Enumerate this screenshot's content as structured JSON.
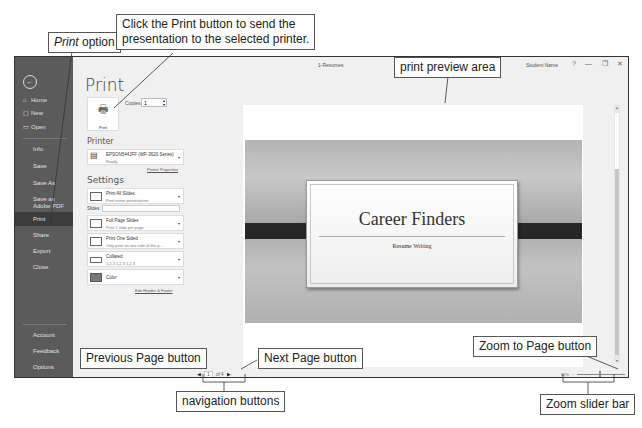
{
  "callouts": {
    "print_option": {
      "italic": "Print",
      "rest": " option"
    },
    "print_button": "Click the Print button to send the presentation to the selected printer.",
    "print_button_line1": "Click the Print button to send the",
    "print_button_line2": "presentation to the selected printer.",
    "preview_area": "print preview area",
    "prev_page": "Previous Page button",
    "next_page": "Next Page button",
    "nav_buttons": "navigation buttons",
    "zoom_to_page": "Zoom to Page button",
    "zoom_slider": "Zoom slider bar"
  },
  "window": {
    "title": "1-Resumes",
    "user": "Student Name",
    "help": "?",
    "minimize": "—",
    "restore": "❐",
    "close": "✕"
  },
  "backstage": {
    "back_icon": "back-arrow-icon",
    "items": [
      {
        "label": "Home",
        "icon": "⌂"
      },
      {
        "label": "New",
        "icon": "▢"
      },
      {
        "label": "Open",
        "icon": "▭"
      },
      {
        "label": "Info"
      },
      {
        "label": "Save"
      },
      {
        "label": "Save As"
      },
      {
        "label": "Save as Adobe PDF"
      },
      {
        "label": "Print",
        "active": true
      },
      {
        "label": "Share"
      },
      {
        "label": "Export"
      },
      {
        "label": "Close"
      },
      {
        "label": "Account"
      },
      {
        "label": "Feedback"
      },
      {
        "label": "Options"
      }
    ]
  },
  "print_panel": {
    "title": "Print",
    "print_button_label": "Print",
    "copies_label": "Copies:",
    "copies_value": "1",
    "printer_heading": "Printer",
    "printer_name": "EPSON544JFF (WF-3620 Series)",
    "printer_status": "Ready",
    "printer_properties_link": "Printer Properties",
    "settings_heading": "Settings",
    "slides_label": "Slides:",
    "slides_value": "",
    "settings": [
      {
        "title": "Print All Slides",
        "subtitle": "Print entire presentation"
      },
      {
        "title": "Full Page Slides",
        "subtitle": "Print 1 slide per page"
      },
      {
        "title": "Print One Sided",
        "subtitle": "Only print on one side of the p..."
      },
      {
        "title": "Collated",
        "subtitle": "1,2,3   1,2,3   1,2,3"
      },
      {
        "title": "Color",
        "subtitle": ""
      }
    ],
    "edit_header_footer_link": "Edit Header & Footer"
  },
  "preview": {
    "slide_title": "Career Finders",
    "slide_subtitle": "Resume Writing",
    "current_page": "1",
    "page_of": "of 4",
    "prev_arrow": "◀",
    "next_arrow": "▶",
    "zoom_percent": "62%",
    "zoom_minus": "−",
    "zoom_plus": "+",
    "zoom_to_page_icon": "⊡"
  }
}
